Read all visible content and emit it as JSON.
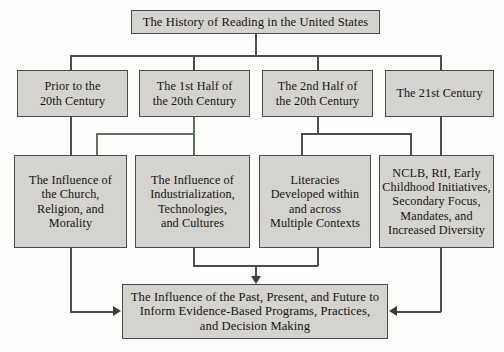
{
  "diagram": {
    "title_node": {
      "label": "The History of Reading in the United States"
    },
    "eras": [
      {
        "label": "Prior to the\n20th Century"
      },
      {
        "label": "The 1st Half of\nthe 20th Century"
      },
      {
        "label": "The 2nd Half of\nthe 20th Century"
      },
      {
        "label": "The 21st Century"
      }
    ],
    "themes": [
      {
        "label": "The Influence of\nthe Church,\nReligion, and\nMorality"
      },
      {
        "label": "The Influence of\nIndustrialization,\nTechnologies,\nand Cultures"
      },
      {
        "label": "Literacies\nDeveloped within\nand across\nMultiple Contexts"
      },
      {
        "label": "NCLB, RtI, Early\nChildhood Initiatives,\nSecondary Focus,\nMandates, and\nIncreased Diversity"
      }
    ],
    "summary_node": {
      "label": "The Influence of the Past, Present, and Future to\nInform Evidence-Based Programs, Practices,\nand Decision Making"
    },
    "colors": {
      "node_fill": "#d5d3ce",
      "node_border": "#4a4a48",
      "connector": "#4d4d4b",
      "connector_accent": "#5d7063",
      "page_background": "#fdfdfb",
      "text": "#15130f"
    }
  }
}
